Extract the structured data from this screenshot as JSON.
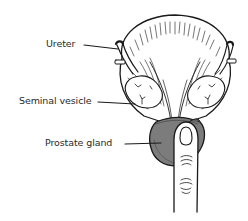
{
  "diagram": {
    "labels": {
      "ureter": "Ureter",
      "seminal_vesicle": "Seminal vesicle",
      "prostate_gland": "Prostate gland"
    },
    "colors": {
      "line": "#1a1a1a",
      "prostate_fill": "#7c7c7c",
      "prostate_shade": "#5e5e5e",
      "background": "#ffffff"
    },
    "structures": [
      "bladder",
      "left-ureter",
      "right-ureter",
      "left-seminal-vesicle",
      "right-seminal-vesicle",
      "prostate-gland",
      "examining-finger"
    ]
  }
}
